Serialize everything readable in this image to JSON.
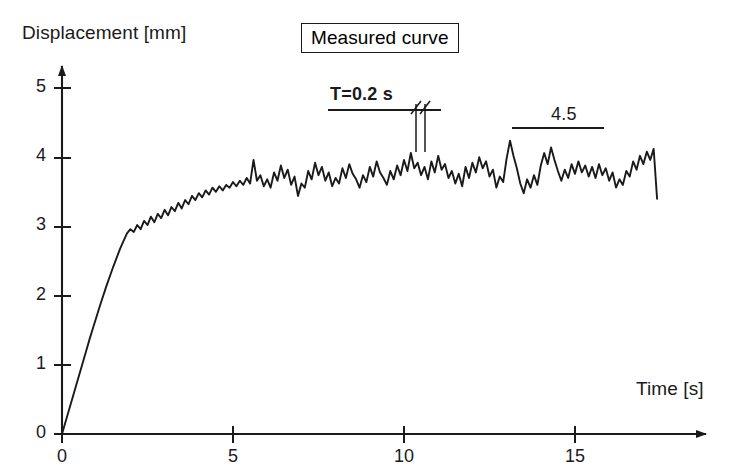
{
  "figure": {
    "background": "#ffffff",
    "ink_color": "#1a1a1a"
  },
  "legend": {
    "label": "Measured curve"
  },
  "annotations": {
    "period": {
      "text": "T=0.2 s",
      "marker_times": [
        10.35,
        10.55
      ]
    },
    "amplitude": {
      "text": "4.5",
      "span_start_time": 13.1,
      "span_end_time": 15.8
    }
  },
  "chart_data": {
    "type": "line",
    "title": "Measured curve",
    "xlabel": "Time [s]",
    "ylabel": "Displacement [mm]",
    "xlim": [
      0,
      18.9
    ],
    "ylim": [
      0,
      5.4
    ],
    "xticks": [
      0,
      5,
      10,
      15
    ],
    "xtick_labels": [
      "0",
      "5",
      "10",
      "15"
    ],
    "yticks": [
      0,
      1,
      2,
      3,
      4,
      5
    ],
    "ytick_labels": [
      "0",
      "1",
      "2",
      "3",
      "4",
      "5"
    ],
    "grid": false,
    "legend_position": "top-center",
    "series": [
      {
        "name": "Measured curve",
        "x": [
          0.0,
          0.1,
          0.2,
          0.3,
          0.4,
          0.5,
          0.6,
          0.7,
          0.8,
          0.9,
          1.0,
          1.1,
          1.2,
          1.3,
          1.4,
          1.5,
          1.6,
          1.7,
          1.8,
          1.9,
          2.0,
          2.1,
          2.2,
          2.3,
          2.4,
          2.5,
          2.6,
          2.7,
          2.8,
          2.9,
          3.0,
          3.1,
          3.2,
          3.3,
          3.4,
          3.5,
          3.6,
          3.7,
          3.8,
          3.9,
          4.0,
          4.1,
          4.2,
          4.3,
          4.4,
          4.5,
          4.6,
          4.7,
          4.8,
          4.9,
          5.0,
          5.1,
          5.2,
          5.3,
          5.4,
          5.5,
          5.6,
          5.7,
          5.8,
          5.9,
          6.0,
          6.1,
          6.2,
          6.3,
          6.4,
          6.5,
          6.6,
          6.7,
          6.8,
          6.9,
          7.0,
          7.1,
          7.2,
          7.3,
          7.4,
          7.5,
          7.6,
          7.7,
          7.8,
          7.9,
          8.0,
          8.1,
          8.2,
          8.3,
          8.4,
          8.5,
          8.6,
          8.7,
          8.8,
          8.9,
          9.0,
          9.1,
          9.2,
          9.3,
          9.4,
          9.5,
          9.6,
          9.7,
          9.8,
          9.9,
          10.0,
          10.1,
          10.2,
          10.3,
          10.4,
          10.5,
          10.6,
          10.7,
          10.8,
          10.9,
          11.0,
          11.1,
          11.2,
          11.3,
          11.4,
          11.5,
          11.6,
          11.7,
          11.8,
          11.9,
          12.0,
          12.1,
          12.2,
          12.3,
          12.4,
          12.5,
          12.6,
          12.7,
          12.8,
          12.9,
          13.0,
          13.1,
          13.2,
          13.3,
          13.4,
          13.5,
          13.6,
          13.7,
          13.8,
          13.9,
          14.0,
          14.1,
          14.2,
          14.3,
          14.4,
          14.5,
          14.6,
          14.7,
          14.8,
          14.9,
          15.0,
          15.1,
          15.2,
          15.3,
          15.4,
          15.5,
          15.6,
          15.7,
          15.8,
          15.9,
          16.0,
          16.1,
          16.2,
          16.3,
          16.4,
          16.5,
          16.6,
          16.7,
          16.8,
          16.9,
          17.0,
          17.1,
          17.2,
          17.3,
          17.4
        ],
        "y": [
          0.0,
          0.17,
          0.34,
          0.51,
          0.68,
          0.85,
          1.02,
          1.19,
          1.36,
          1.52,
          1.68,
          1.84,
          1.99,
          2.14,
          2.28,
          2.42,
          2.55,
          2.68,
          2.79,
          2.9,
          2.96,
          2.92,
          3.02,
          2.96,
          3.08,
          3.02,
          3.14,
          3.06,
          3.18,
          3.12,
          3.24,
          3.16,
          3.28,
          3.22,
          3.34,
          3.26,
          3.38,
          3.32,
          3.44,
          3.38,
          3.48,
          3.42,
          3.52,
          3.46,
          3.56,
          3.5,
          3.58,
          3.52,
          3.6,
          3.56,
          3.64,
          3.58,
          3.66,
          3.6,
          3.7,
          3.62,
          3.96,
          3.66,
          3.74,
          3.58,
          3.68,
          3.56,
          3.78,
          3.66,
          3.88,
          3.7,
          3.82,
          3.6,
          3.72,
          3.44,
          3.62,
          3.56,
          3.8,
          3.68,
          3.92,
          3.74,
          3.86,
          3.66,
          3.78,
          3.58,
          3.7,
          3.62,
          3.84,
          3.7,
          3.9,
          3.76,
          3.68,
          3.56,
          3.74,
          3.64,
          3.86,
          3.72,
          3.94,
          3.78,
          3.7,
          3.6,
          3.8,
          3.68,
          3.88,
          3.74,
          3.96,
          3.8,
          4.06,
          3.84,
          3.92,
          3.74,
          3.86,
          3.68,
          3.94,
          3.78,
          4.02,
          3.82,
          3.9,
          3.7,
          3.8,
          3.62,
          3.76,
          3.58,
          3.86,
          3.7,
          3.92,
          3.78,
          4.0,
          3.84,
          3.94,
          3.72,
          3.82,
          3.56,
          3.72,
          3.64,
          3.98,
          4.24,
          4.02,
          3.84,
          3.62,
          3.48,
          3.68,
          3.56,
          3.74,
          3.6,
          3.88,
          4.06,
          3.9,
          4.14,
          3.96,
          3.8,
          3.66,
          3.82,
          3.7,
          3.9,
          3.76,
          3.94,
          3.78,
          3.88,
          3.72,
          3.86,
          3.7,
          3.9,
          3.74,
          3.84,
          3.66,
          3.78,
          3.56,
          3.68,
          3.6,
          3.8,
          3.72,
          3.94,
          3.82,
          4.02,
          3.9,
          4.08,
          3.96,
          4.12,
          3.4
        ]
      }
    ]
  }
}
